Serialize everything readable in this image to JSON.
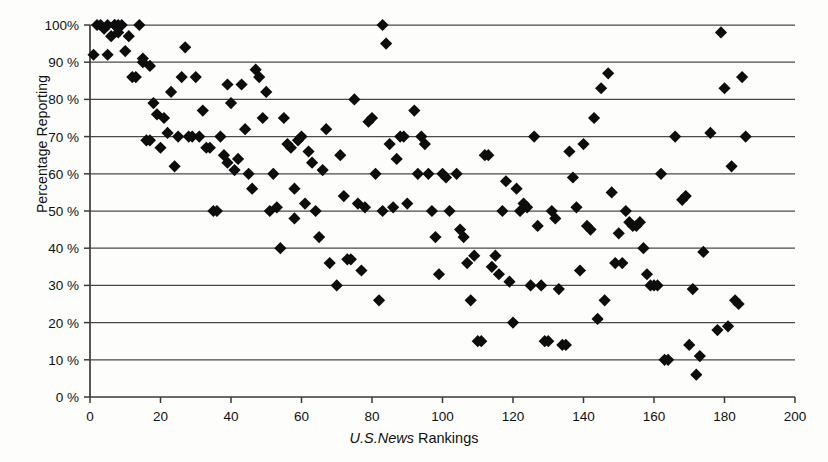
{
  "chart_data": {
    "type": "scatter",
    "title": "",
    "xlabel_italic": "U.S.News",
    "xlabel_rest": " Rankings",
    "xlabel": "U.S.News Rankings",
    "ylabel": "Percentage Reporting",
    "xlim": [
      0,
      200
    ],
    "ylim": [
      0,
      100
    ],
    "xticks": [
      0,
      20,
      40,
      60,
      80,
      100,
      120,
      140,
      160,
      180,
      200
    ],
    "xticklabels": [
      "0",
      "20",
      "40",
      "60",
      "80",
      "100",
      "120",
      "140",
      "160",
      "180",
      "200"
    ],
    "yticks": [
      0,
      10,
      20,
      30,
      40,
      50,
      60,
      70,
      80,
      90,
      100
    ],
    "yticklabels": [
      "0 %",
      "10 %",
      "20 %",
      "30 %",
      "40 %",
      "50 %",
      "60 %",
      "70 %",
      "80 %",
      "90 %",
      "100%"
    ],
    "grid": "horizontal",
    "legend": "none",
    "marker": "diamond",
    "marker_color": "#0d0d0d",
    "marker_size": 9,
    "series": [
      {
        "name": "Institutions",
        "points": [
          [
            1,
            92
          ],
          [
            2,
            100
          ],
          [
            3,
            100
          ],
          [
            4,
            99
          ],
          [
            5,
            100
          ],
          [
            5,
            92
          ],
          [
            6,
            97
          ],
          [
            7,
            100
          ],
          [
            7,
            100
          ],
          [
            8,
            100
          ],
          [
            8,
            98
          ],
          [
            9,
            100
          ],
          [
            10,
            93
          ],
          [
            11,
            97
          ],
          [
            12,
            86
          ],
          [
            13,
            86
          ],
          [
            14,
            100
          ],
          [
            15,
            91
          ],
          [
            15,
            90
          ],
          [
            16,
            69
          ],
          [
            17,
            69
          ],
          [
            17,
            89
          ],
          [
            18,
            79
          ],
          [
            19,
            76
          ],
          [
            20,
            67
          ],
          [
            21,
            75
          ],
          [
            22,
            71
          ],
          [
            23,
            82
          ],
          [
            24,
            62
          ],
          [
            25,
            70
          ],
          [
            26,
            86
          ],
          [
            27,
            94
          ],
          [
            28,
            70
          ],
          [
            29,
            70
          ],
          [
            30,
            86
          ],
          [
            31,
            70
          ],
          [
            32,
            77
          ],
          [
            33,
            67
          ],
          [
            34,
            67
          ],
          [
            35,
            50
          ],
          [
            36,
            50
          ],
          [
            37,
            70
          ],
          [
            38,
            65
          ],
          [
            39,
            63
          ],
          [
            39,
            84
          ],
          [
            40,
            79
          ],
          [
            41,
            61
          ],
          [
            42,
            64
          ],
          [
            43,
            84
          ],
          [
            44,
            72
          ],
          [
            45,
            60
          ],
          [
            46,
            56
          ],
          [
            47,
            88
          ],
          [
            48,
            86
          ],
          [
            49,
            75
          ],
          [
            50,
            82
          ],
          [
            51,
            50
          ],
          [
            52,
            60
          ],
          [
            53,
            51
          ],
          [
            54,
            40
          ],
          [
            55,
            75
          ],
          [
            56,
            68
          ],
          [
            57,
            67
          ],
          [
            58,
            56
          ],
          [
            58,
            48
          ],
          [
            59,
            69
          ],
          [
            60,
            70
          ],
          [
            61,
            52
          ],
          [
            62,
            66
          ],
          [
            63,
            63
          ],
          [
            64,
            50
          ],
          [
            65,
            43
          ],
          [
            66,
            61
          ],
          [
            67,
            72
          ],
          [
            68,
            36
          ],
          [
            70,
            30
          ],
          [
            71,
            65
          ],
          [
            72,
            54
          ],
          [
            73,
            37
          ],
          [
            74,
            37
          ],
          [
            75,
            80
          ],
          [
            76,
            52
          ],
          [
            77,
            34
          ],
          [
            78,
            51
          ],
          [
            79,
            74
          ],
          [
            80,
            75
          ],
          [
            81,
            60
          ],
          [
            82,
            26
          ],
          [
            83,
            100
          ],
          [
            83,
            50
          ],
          [
            84,
            95
          ],
          [
            85,
            68
          ],
          [
            86,
            51
          ],
          [
            87,
            64
          ],
          [
            88,
            70
          ],
          [
            89,
            70
          ],
          [
            90,
            52
          ],
          [
            92,
            77
          ],
          [
            93,
            60
          ],
          [
            94,
            70
          ],
          [
            95,
            68
          ],
          [
            96,
            60
          ],
          [
            97,
            50
          ],
          [
            98,
            43
          ],
          [
            99,
            33
          ],
          [
            100,
            60
          ],
          [
            101,
            59
          ],
          [
            102,
            50
          ],
          [
            104,
            60
          ],
          [
            105,
            45
          ],
          [
            106,
            43
          ],
          [
            107,
            36
          ],
          [
            108,
            26
          ],
          [
            109,
            38
          ],
          [
            110,
            15
          ],
          [
            111,
            15
          ],
          [
            112,
            65
          ],
          [
            113,
            65
          ],
          [
            114,
            35
          ],
          [
            115,
            38
          ],
          [
            116,
            33
          ],
          [
            117,
            50
          ],
          [
            118,
            58
          ],
          [
            119,
            31
          ],
          [
            120,
            20
          ],
          [
            121,
            56
          ],
          [
            122,
            50
          ],
          [
            123,
            52
          ],
          [
            124,
            51
          ],
          [
            125,
            30
          ],
          [
            126,
            70
          ],
          [
            127,
            46
          ],
          [
            128,
            30
          ],
          [
            129,
            15
          ],
          [
            130,
            15
          ],
          [
            131,
            50
          ],
          [
            132,
            48
          ],
          [
            133,
            29
          ],
          [
            134,
            14
          ],
          [
            135,
            14
          ],
          [
            136,
            66
          ],
          [
            137,
            59
          ],
          [
            138,
            51
          ],
          [
            139,
            34
          ],
          [
            140,
            68
          ],
          [
            141,
            46
          ],
          [
            142,
            45
          ],
          [
            143,
            75
          ],
          [
            144,
            21
          ],
          [
            145,
            83
          ],
          [
            146,
            26
          ],
          [
            147,
            87
          ],
          [
            148,
            55
          ],
          [
            149,
            36
          ],
          [
            150,
            44
          ],
          [
            151,
            36
          ],
          [
            152,
            50
          ],
          [
            153,
            47
          ],
          [
            154,
            46
          ],
          [
            155,
            46
          ],
          [
            156,
            47
          ],
          [
            157,
            40
          ],
          [
            158,
            33
          ],
          [
            159,
            30
          ],
          [
            160,
            30
          ],
          [
            161,
            30
          ],
          [
            162,
            60
          ],
          [
            163,
            10
          ],
          [
            164,
            10
          ],
          [
            166,
            70
          ],
          [
            168,
            53
          ],
          [
            169,
            54
          ],
          [
            170,
            14
          ],
          [
            171,
            29
          ],
          [
            172,
            6
          ],
          [
            173,
            11
          ],
          [
            174,
            39
          ],
          [
            176,
            71
          ],
          [
            178,
            18
          ],
          [
            179,
            98
          ],
          [
            180,
            83
          ],
          [
            181,
            19
          ],
          [
            182,
            62
          ],
          [
            183,
            26
          ],
          [
            184,
            25
          ],
          [
            185,
            86
          ],
          [
            186,
            70
          ]
        ]
      }
    ]
  }
}
